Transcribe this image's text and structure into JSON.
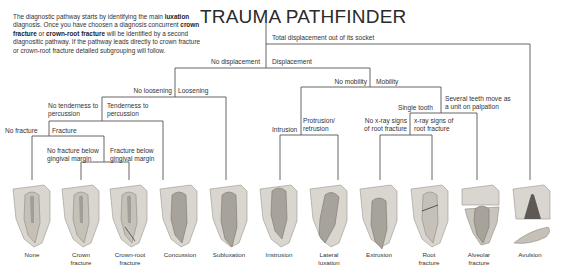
{
  "title": "TRAUMA PATHFINDER",
  "intro": {
    "p1": "The diagnostic pathway starts by identifying the main ",
    "b1": "luxation",
    "p2": " diagnosis. Once you have choosen a diagnosis concurrent ",
    "b2": "crown fracture",
    "p3": " or ",
    "b3": "crown-root fracture",
    "p4": " will be identified by a second diagnositic pathway. If the pathway leads directly to crown fracture or crown-root fracture detailed subgrouping will follow."
  },
  "branches": {
    "total_displacement": "Total displacement out of its socket",
    "no_displacement": "No displacement",
    "displacement": "Displacement",
    "no_loosening": "No loosening",
    "loosening": "Loosening",
    "no_tenderness_1": "No tenderness to",
    "no_tenderness_2": "percussion",
    "tenderness_1": "Tenderness to",
    "tenderness_2": "percussion",
    "no_fracture": "No fracture",
    "fracture": "Fracture",
    "no_fracture_below_1": "No fracture below",
    "no_fracture_below_2": "gingival margin",
    "fracture_below_1": "Fracture below",
    "fracture_below_2": "gingival margin",
    "no_mobility": "No mobility",
    "mobility": "Mobility",
    "intrusion": "Intrusion",
    "protrusion_1": "Protrusion/",
    "protrusion_2": "retrusion",
    "single_tooth": "Single tooth",
    "several_teeth_1": "Several teeth move as",
    "several_teeth_2": "a unit on palpation",
    "no_xray_1": "No x-ray signs",
    "no_xray_2": "of root fracture",
    "xray_1": "x-ray signs of",
    "xray_2": "root fracture"
  },
  "diagnoses": [
    {
      "line1": "None",
      "line2": ""
    },
    {
      "line1": "Crown",
      "line2": "fracture"
    },
    {
      "line1": "Crown-root",
      "line2": "fracture"
    },
    {
      "line1": "Concussion",
      "line2": ""
    },
    {
      "line1": "Subluxation",
      "line2": ""
    },
    {
      "line1": "Instrusion",
      "line2": ""
    },
    {
      "line1": "Lateral",
      "line2": "luxation"
    },
    {
      "line1": "Extrusion",
      "line2": ""
    },
    {
      "line1": "Root",
      "line2": "fracture"
    },
    {
      "line1": "Alveolar",
      "line2": "fracture"
    },
    {
      "line1": "Avulsion",
      "line2": ""
    }
  ],
  "colors": {
    "line": "#555555",
    "bone": "#d9d6cf",
    "tooth": "#b9b6ae",
    "pulp": "#8f8a82"
  }
}
